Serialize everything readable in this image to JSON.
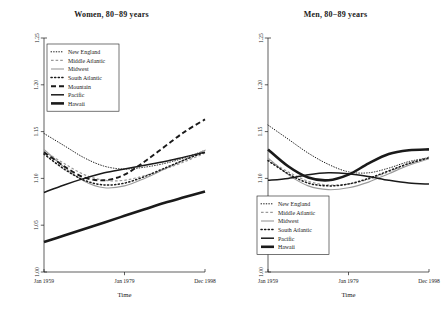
{
  "figure": {
    "width": 447,
    "height": 318,
    "background": "#ffffff",
    "ink": "#1a1a1a"
  },
  "panels": [
    {
      "id": "women-80-89",
      "title": "Women, 80−89 years",
      "xlabel": "Time",
      "legend_position": "top-left"
    },
    {
      "id": "men-80-89",
      "title": "Men, 80−89 years",
      "xlabel": "Time",
      "legend_position": "bottom-left"
    }
  ],
  "axes": {
    "x_ticks": [
      "Jan 1959",
      "Jan 1979",
      "Dec 1998"
    ],
    "y_ticks": [
      "1.00",
      "1.05",
      "1.10",
      "1.15",
      "1.20",
      "1.25"
    ],
    "xlabel": "Time",
    "ylim": [
      1.0,
      1.25
    ],
    "xlim": [
      1959,
      1998.99
    ]
  },
  "legend_left": {
    "items": [
      {
        "label": "New England",
        "style": "dotted-fine",
        "width": 0.9
      },
      {
        "label": "Middle Atlantic",
        "style": "dashed-short",
        "width": 1.1
      },
      {
        "label": "Midwest",
        "style": "solid-gray",
        "width": 1.2
      },
      {
        "label": "South Atlantic",
        "style": "dotted-coarse",
        "width": 1.3
      },
      {
        "label": "Mountain",
        "style": "dashed-long",
        "width": 1.8
      },
      {
        "label": "Pacific",
        "style": "solid-black",
        "width": 2.0
      },
      {
        "label": "Hawaii",
        "style": "solid-heavy",
        "width": 2.8
      }
    ]
  },
  "legend_right": {
    "items": [
      {
        "label": "New England",
        "style": "dotted-fine",
        "width": 0.9
      },
      {
        "label": "Middle Atlantic",
        "style": "dashed-short",
        "width": 1.1
      },
      {
        "label": "Midwest",
        "style": "solid-gray",
        "width": 1.2
      },
      {
        "label": "South Atlantic",
        "style": "dotted-coarse",
        "width": 1.3
      },
      {
        "label": "Pacific",
        "style": "solid-black",
        "width": 2.0
      },
      {
        "label": "Hawaii",
        "style": "solid-heavy",
        "width": 2.8
      }
    ]
  },
  "chart_data": {
    "type": "line",
    "xlabel": "Time",
    "ylabel": "",
    "xlim": [
      1959,
      1999
    ],
    "ylim": [
      1.0,
      1.25
    ],
    "xticks": [
      1959,
      1979,
      1999
    ],
    "xticklabels": [
      "Jan 1959",
      "Jan 1979",
      "Dec 1998"
    ],
    "yticks": [
      1.0,
      1.05,
      1.1,
      1.15,
      1.2,
      1.25
    ],
    "yticklabels": [
      "1.00",
      "1.05",
      "1.10",
      "1.15",
      "1.20",
      "1.25"
    ],
    "grid": false,
    "panels": [
      {
        "title": "Women, 80−89 years",
        "x": [
          1959,
          1964,
          1969,
          1974,
          1979,
          1984,
          1989,
          1994,
          1999
        ],
        "series": [
          {
            "name": "New England",
            "style": "dotted-fine",
            "values": [
              1.148,
              1.135,
              1.122,
              1.113,
              1.11,
              1.112,
              1.116,
              1.122,
              1.13
            ]
          },
          {
            "name": "Middle Atlantic",
            "style": "dashed-short",
            "values": [
              1.129,
              1.116,
              1.104,
              1.098,
              1.098,
              1.103,
              1.11,
              1.118,
              1.127
            ]
          },
          {
            "name": "Midwest",
            "style": "solid-gray",
            "values": [
              1.131,
              1.112,
              1.097,
              1.09,
              1.092,
              1.1,
              1.11,
              1.12,
              1.13
            ]
          },
          {
            "name": "South Atlantic",
            "style": "dotted-coarse",
            "values": [
              1.126,
              1.11,
              1.098,
              1.093,
              1.095,
              1.102,
              1.111,
              1.12,
              1.128
            ]
          },
          {
            "name": "Mountain",
            "style": "dashed-long",
            "values": [
              1.128,
              1.113,
              1.101,
              1.098,
              1.104,
              1.118,
              1.134,
              1.15,
              1.163
            ]
          },
          {
            "name": "Pacific",
            "style": "solid-black",
            "values": [
              1.085,
              1.093,
              1.1,
              1.106,
              1.11,
              1.114,
              1.118,
              1.123,
              1.128
            ]
          },
          {
            "name": "Hawaii",
            "style": "solid-heavy",
            "values": [
              1.032,
              1.039,
              1.046,
              1.053,
              1.06,
              1.067,
              1.074,
              1.08,
              1.086
            ]
          }
        ]
      },
      {
        "title": "Men, 80−89 years",
        "x": [
          1959,
          1964,
          1969,
          1974,
          1979,
          1984,
          1989,
          1994,
          1999
        ],
        "series": [
          {
            "name": "New England",
            "style": "dotted-fine",
            "values": [
              1.157,
              1.142,
              1.127,
              1.115,
              1.107,
              1.106,
              1.111,
              1.118,
              1.122
            ]
          },
          {
            "name": "Middle Atlantic",
            "style": "dashed-short",
            "values": [
              1.12,
              1.107,
              1.097,
              1.093,
              1.094,
              1.099,
              1.107,
              1.115,
              1.123
            ]
          },
          {
            "name": "Midwest",
            "style": "solid-gray",
            "values": [
              1.122,
              1.104,
              1.092,
              1.088,
              1.09,
              1.096,
              1.105,
              1.114,
              1.121
            ]
          },
          {
            "name": "South Atlantic",
            "style": "dotted-coarse",
            "values": [
              1.119,
              1.105,
              1.095,
              1.092,
              1.094,
              1.1,
              1.108,
              1.116,
              1.122
            ]
          },
          {
            "name": "Pacific",
            "style": "solid-black",
            "values": [
              1.098,
              1.1,
              1.104,
              1.106,
              1.105,
              1.102,
              1.098,
              1.095,
              1.094
            ]
          },
          {
            "name": "Hawaii",
            "style": "solid-heavy",
            "values": [
              1.131,
              1.113,
              1.101,
              1.098,
              1.104,
              1.116,
              1.126,
              1.13,
              1.131
            ]
          }
        ]
      }
    ]
  }
}
